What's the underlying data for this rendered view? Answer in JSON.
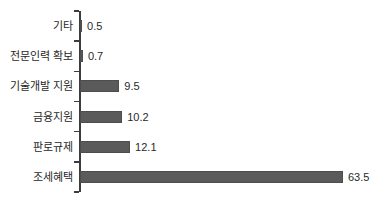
{
  "chart_data": {
    "type": "bar",
    "orientation": "horizontal",
    "title": "",
    "xlabel": "",
    "ylabel": "",
    "categories": [
      "기타",
      "전문인력 확보",
      "기술개발 지원",
      "금융지원",
      "판로규제",
      "조세혜택"
    ],
    "values": [
      0.5,
      0.7,
      9.5,
      10.2,
      12.1,
      63.5
    ],
    "value_labels": [
      "0.5",
      "0.7",
      "9.5",
      "10.2",
      "12.1",
      "63.5"
    ],
    "xlim": [
      0,
      70
    ],
    "grid": false,
    "legend": "none",
    "bar_color": "#5a5a5a",
    "axis_color": "#3c3c3c",
    "text_color": "#1f1f1f"
  }
}
